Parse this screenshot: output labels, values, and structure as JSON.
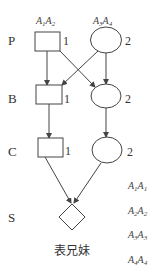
{
  "diagram": {
    "type": "pedigree",
    "generations": [
      {
        "label": "P"
      },
      {
        "label": "B"
      },
      {
        "label": "C"
      },
      {
        "label": "S"
      }
    ],
    "parents": {
      "male": {
        "genotype_a": "A",
        "sub_a": "1",
        "genotype_b": "A",
        "sub_b": "2",
        "number": "1"
      },
      "female": {
        "genotype_a": "A",
        "sub_a": "3",
        "genotype_b": "A",
        "sub_b": "4",
        "number": "2"
      }
    },
    "individuals": {
      "B_male_number": "1",
      "B_female_number": "2",
      "C_male_number": "1",
      "C_female_number": "2"
    },
    "offspring_caption": "表兄妹",
    "offspring_genotypes": [
      {
        "a": "A",
        "sa": "1",
        "b": "A",
        "sb": "1"
      },
      {
        "a": "A",
        "sa": "2",
        "b": "A",
        "sb": "2"
      },
      {
        "a": "A",
        "sa": "3",
        "b": "A",
        "sb": "3"
      },
      {
        "a": "A",
        "sa": "4",
        "b": "A",
        "sb": "4"
      }
    ]
  }
}
